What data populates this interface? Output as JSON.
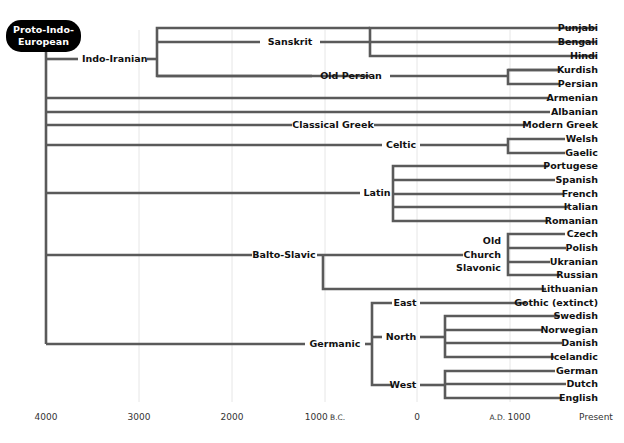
{
  "root": {
    "line1": "Proto-Indo-",
    "line2": "European"
  },
  "branches": {
    "indo_iranian": "Indo-Iranian",
    "sanskrit": "Sanskrit",
    "old_persian": "Old Persian",
    "classical_greek": "Classical Greek",
    "celtic": "Celtic",
    "latin": "Latin",
    "balto_slavic": "Balto-Slavic",
    "old_church_slavonic": {
      "line1": "Old",
      "line2": "Church",
      "line3": "Slavonic"
    },
    "germanic": "Germanic",
    "east": "East",
    "north": "North",
    "west": "West"
  },
  "leaves": [
    "Punjabi",
    "Bengali",
    "Hindi",
    "Kurdish",
    "Persian",
    "Armenian",
    "Albanian",
    "Modern Greek",
    "Welsh",
    "Gaelic",
    "Portugese",
    "Spanish",
    "French",
    "Italian",
    "Romanian",
    "Czech",
    "Polish",
    "Ukranian",
    "Russian",
    "Lithuanian",
    "Gothic (extinct)",
    "Swedish",
    "Norwegian",
    "Danish",
    "Icelandic",
    "German",
    "Dutch",
    "English"
  ],
  "axis": {
    "t4000": "4000",
    "t3000": "3000",
    "t2000": "2000",
    "t1000bc_num": "1000",
    "t1000bc_suffix": " B.C.",
    "t0": "0",
    "tad_prefix": "A.D. ",
    "tad_num": "1000",
    "present": "Present"
  },
  "colors": {
    "line": "#5a5a5a",
    "root_bg": "#000000",
    "grid": "#e6e6e6"
  }
}
